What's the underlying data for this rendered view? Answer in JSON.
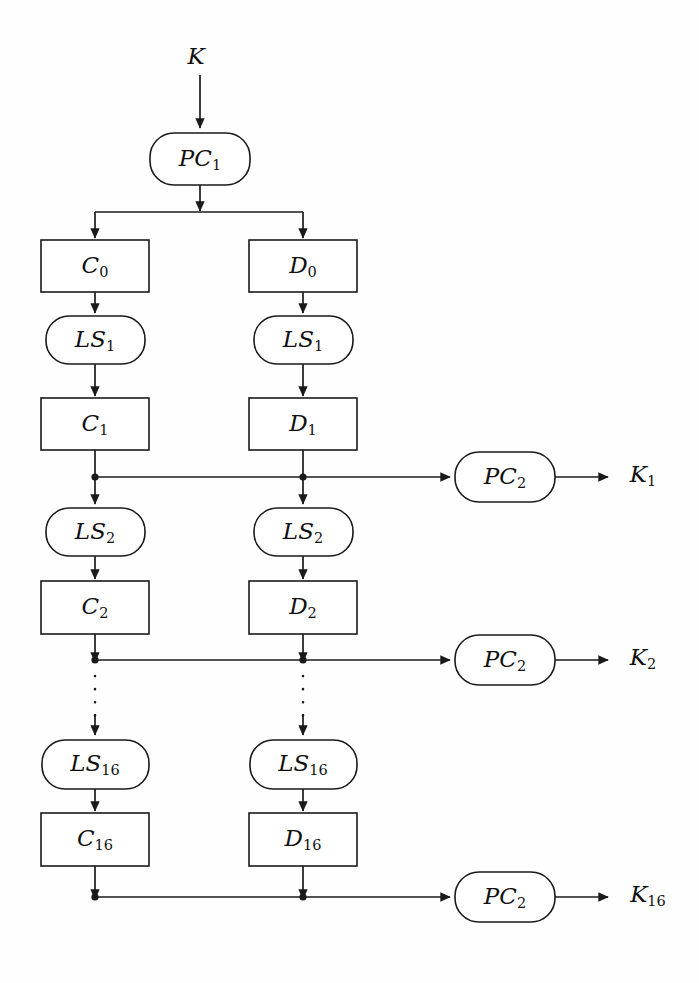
{
  "diagram": {
    "type": "flowchart",
    "background_color": "#fefefe",
    "line_color": "#1a1a1a",
    "input": {
      "label": "K"
    },
    "permutation_choice_1": {
      "label": "PC",
      "sub": "1"
    },
    "rounds": [
      {
        "index": 0,
        "left_register": {
          "label": "C",
          "sub": "0"
        },
        "right_register": {
          "label": "D",
          "sub": "0"
        }
      },
      {
        "index": 1,
        "left_shift": {
          "label": "LS",
          "sub": "1"
        },
        "right_shift": {
          "label": "LS",
          "sub": "1"
        },
        "left_register": {
          "label": "C",
          "sub": "1"
        },
        "right_register": {
          "label": "D",
          "sub": "1"
        },
        "compression": {
          "label": "PC",
          "sub": "2"
        },
        "subkey": {
          "label": "K",
          "sub": "1"
        }
      },
      {
        "index": 2,
        "left_shift": {
          "label": "LS",
          "sub": "2"
        },
        "right_shift": {
          "label": "LS",
          "sub": "2"
        },
        "left_register": {
          "label": "C",
          "sub": "2"
        },
        "right_register": {
          "label": "D",
          "sub": "2"
        },
        "compression": {
          "label": "PC",
          "sub": "2"
        },
        "subkey": {
          "label": "K",
          "sub": "2"
        }
      },
      {
        "index": 16,
        "left_shift": {
          "label": "LS",
          "sub": "16"
        },
        "right_shift": {
          "label": "LS",
          "sub": "16"
        },
        "left_register": {
          "label": "C",
          "sub": "16"
        },
        "right_register": {
          "label": "D",
          "sub": "16"
        },
        "compression": {
          "label": "PC",
          "sub": "2"
        },
        "subkey": {
          "label": "K",
          "sub": "16"
        }
      }
    ],
    "ellipsis": {
      "style": "vertical-dotted",
      "dots": 3,
      "meaning": "rounds 3 through 15 omitted"
    }
  }
}
